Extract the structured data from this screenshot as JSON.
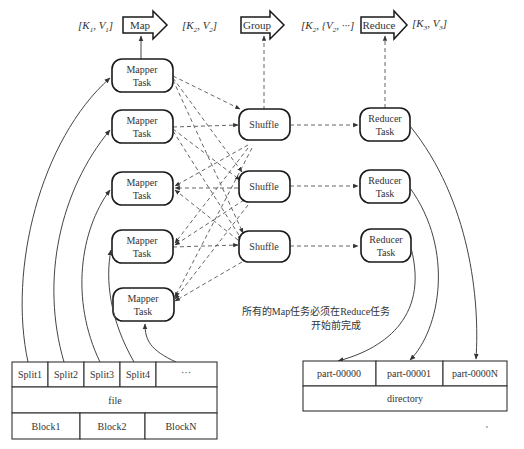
{
  "header": {
    "kv_input": [
      "[K",
      "1",
      ", V",
      "1",
      "]"
    ],
    "kv_map_output": [
      "[K",
      "2",
      ", V",
      "2",
      "]"
    ],
    "kv_group_output": [
      "[K",
      "2",
      ", {V",
      "2",
      ", ···]"
    ],
    "kv_reduce_output": [
      "[K",
      "3",
      ", V",
      "3",
      "]"
    ],
    "stages": [
      {
        "label": "Map"
      },
      {
        "label": "Group"
      },
      {
        "label": "Reduce"
      }
    ]
  },
  "mappers": [
    {
      "line1": "Mapper",
      "line2": "Task"
    },
    {
      "line1": "Mapper",
      "line2": "Task"
    },
    {
      "line1": "Mapper",
      "line2": "Task"
    },
    {
      "line1": "Mapper",
      "line2": "Task"
    },
    {
      "line1": "Mapper",
      "line2": "Task"
    }
  ],
  "shuffles": [
    {
      "label": "Shuffle"
    },
    {
      "label": "Shuffle"
    },
    {
      "label": "Shuffle"
    }
  ],
  "reducers": [
    {
      "line1": "Reducer",
      "line2": "Task"
    },
    {
      "line1": "Reducer",
      "line2": "Task"
    },
    {
      "line1": "Reducer",
      "line2": "Task"
    }
  ],
  "note": {
    "line1": "所有的Map任务必须在Reduce任务",
    "line2": "开始前完成"
  },
  "input_file": {
    "splits": [
      "Split1",
      "Split2",
      "Split3",
      "Split4",
      "···"
    ],
    "file_label": "file",
    "blocks": [
      "Block1",
      "Block2",
      "BlockN"
    ]
  },
  "output_dir": {
    "parts": [
      "part-00000",
      "part-00001",
      "part-0000N"
    ],
    "dir_label": "directory"
  }
}
